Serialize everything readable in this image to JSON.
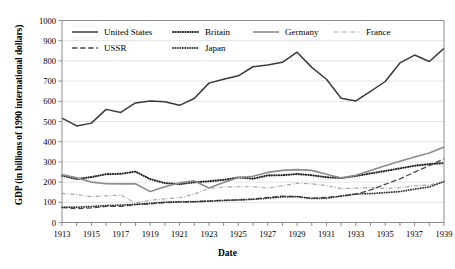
{
  "chart_data": {
    "type": "line",
    "title": "",
    "xlabel": "Date",
    "ylabel": "GDP (in billions of 1990 international dollars)",
    "xlim": [
      1913,
      1939
    ],
    "ylim": [
      0,
      1000
    ],
    "ytick_step": 100,
    "xtick_step": 2,
    "grid": "horizontal",
    "legend_position": "top-left-inside",
    "x": [
      1913,
      1914,
      1915,
      1916,
      1917,
      1918,
      1919,
      1920,
      1921,
      1922,
      1923,
      1924,
      1925,
      1926,
      1927,
      1928,
      1929,
      1930,
      1931,
      1932,
      1933,
      1934,
      1935,
      1936,
      1937,
      1938,
      1939
    ],
    "yticks": [
      0,
      100,
      200,
      300,
      400,
      500,
      600,
      700,
      800,
      900,
      1000
    ],
    "xticks": [
      1913,
      1915,
      1917,
      1919,
      1921,
      1923,
      1925,
      1927,
      1929,
      1931,
      1933,
      1935,
      1937,
      1939
    ],
    "series": [
      {
        "name": "United States",
        "style": "solid",
        "color": "#3a3a3a",
        "width": 1.5,
        "values": [
          517,
          478,
          492,
          560,
          545,
          592,
          602,
          598,
          580,
          614,
          690,
          709,
          726,
          771,
          780,
          793,
          843,
          768,
          709,
          615,
          602,
          649,
          698,
          790,
          829,
          797,
          862
        ]
      },
      {
        "name": "Britain",
        "style": "dotted",
        "color": "#262626",
        "width": 2.1,
        "values": [
          232,
          215,
          225,
          239,
          241,
          252,
          215,
          195,
          190,
          199,
          204,
          211,
          223,
          217,
          233,
          234,
          240,
          234,
          224,
          220,
          230,
          243,
          255,
          268,
          281,
          289,
          294
        ]
      },
      {
        "name": "Germany",
        "style": "solid",
        "color": "#8c8c8c",
        "width": 1.6,
        "values": [
          237,
          221,
          200,
          192,
          191,
          192,
          153,
          177,
          196,
          206,
          171,
          198,
          223,
          229,
          248,
          258,
          262,
          258,
          239,
          220,
          234,
          257,
          281,
          303,
          324,
          344,
          374
        ]
      },
      {
        "name": "France",
        "style": "dashdot",
        "color": "#a6a6a6",
        "width": 1.2,
        "values": [
          144,
          138,
          128,
          132,
          136,
          97,
          110,
          117,
          123,
          140,
          169,
          176,
          177,
          177,
          171,
          182,
          194,
          192,
          182,
          168,
          170,
          173,
          169,
          172,
          182,
          186,
          199
        ]
      },
      {
        "name": "USSR",
        "style": "dashed",
        "color": "#4a4a4a",
        "width": 1.3,
        "values": [
          74,
          69,
          72,
          80,
          80,
          88,
          92,
          98,
          102,
          103,
          106,
          110,
          112,
          116,
          124,
          131,
          128,
          120,
          125,
          130,
          140,
          161,
          189,
          216,
          249,
          282,
          315
        ]
      },
      {
        "name": "Japan",
        "style": "dotted-fine",
        "color": "#333333",
        "width": 1.8,
        "values": [
          76,
          76,
          79,
          84,
          86,
          90,
          95,
          101,
          102,
          103,
          106,
          109,
          112,
          115,
          120,
          127,
          128,
          119,
          120,
          131,
          141,
          143,
          148,
          153,
          165,
          176,
          203
        ]
      }
    ],
    "legend_rows": [
      [
        "United States",
        "Britain",
        "Germany",
        "France"
      ],
      [
        "USSR",
        "Japan"
      ]
    ]
  }
}
